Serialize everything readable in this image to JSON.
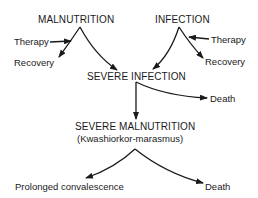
{
  "diagram": {
    "nodes": {
      "malnutrition": "MALNUTRITION",
      "infection": "INFECTION",
      "therapy_left": "Therapy",
      "recovery_left": "Recovery",
      "therapy_right": "Therapy",
      "recovery_right": "Recovery",
      "severe_infection": "SEVERE INFECTION",
      "death_1": "Death",
      "severe_malnutrition": "SEVERE MALNUTRITION",
      "severe_malnutrition_sub": "(Kwashiorkor-marasmus)",
      "prolonged_convalescence": "Prolonged convalescence",
      "death_2": "Death"
    },
    "edges": [
      {
        "from": "MALNUTRITION",
        "to": "Recovery"
      },
      {
        "from": "Therapy",
        "to": "MALNUTRITION → Recovery"
      },
      {
        "from": "MALNUTRITION",
        "to": "SEVERE INFECTION"
      },
      {
        "from": "INFECTION",
        "to": "SEVERE INFECTION"
      },
      {
        "from": "INFECTION",
        "to": "Recovery"
      },
      {
        "from": "Therapy",
        "to": "INFECTION → Recovery"
      },
      {
        "from": "SEVERE INFECTION",
        "to": "Death"
      },
      {
        "from": "SEVERE INFECTION",
        "to": "SEVERE MALNUTRITION"
      },
      {
        "from": "SEVERE MALNUTRITION",
        "to": "Prolonged convalescence"
      },
      {
        "from": "SEVERE MALNUTRITION",
        "to": "Death"
      }
    ],
    "colors": {
      "ink": "#1a1a1a",
      "background": "#ffffff"
    }
  }
}
